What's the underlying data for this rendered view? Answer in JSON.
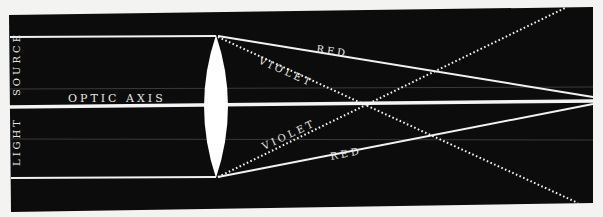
{
  "diagram": {
    "labels": {
      "source_left": "SOURCE",
      "light_left": "LIGHT",
      "optic_axis": "OPTIC AXIS",
      "red_top": "RED",
      "violet_top": "VIOLET",
      "violet_bottom": "VIOLET",
      "red_bottom": "RED"
    },
    "colors": {
      "page_background": "#f3f3f1",
      "panel_background": "#0c0c0c",
      "ray_color": "#f2f2f2",
      "faint_line": "#3a3a3a"
    },
    "components": [
      {
        "name": "light-source",
        "description": "Parallel light rays entering from left"
      },
      {
        "name": "converging-lens",
        "description": "Biconvex lens centered on optic axis"
      },
      {
        "name": "red-rays",
        "style": "solid",
        "focus": "far (right)"
      },
      {
        "name": "violet-rays",
        "style": "dotted",
        "focus": "near lens"
      }
    ]
  }
}
